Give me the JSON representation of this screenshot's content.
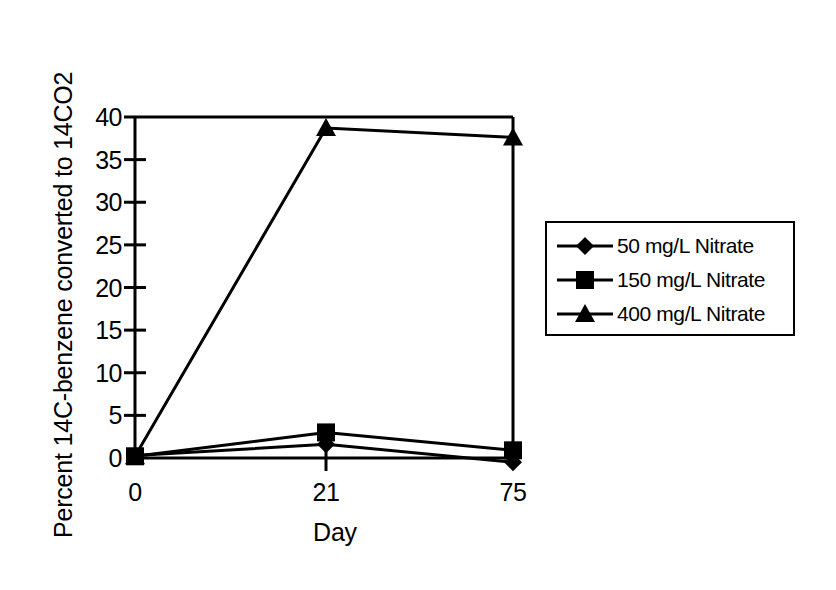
{
  "chart_data": {
    "type": "line",
    "title": "",
    "subtitle": "",
    "xlabel": "Day",
    "ylabel": "Percent 14C-benzene converted to 14CO2",
    "categories": [
      "0",
      "21",
      "75"
    ],
    "x": [
      0,
      21,
      75
    ],
    "xtick_labels": [
      "0",
      "21",
      "75"
    ],
    "ytick_labels": [
      "0",
      "5",
      "10",
      "15",
      "20",
      "25",
      "30",
      "35",
      "40"
    ],
    "ytick_values": [
      0,
      5,
      10,
      15,
      20,
      25,
      30,
      35,
      40
    ],
    "ylim": [
      0,
      40
    ],
    "grid": false,
    "legend_position": "right",
    "line_color": "#000000",
    "series": [
      {
        "name": "50 mg/L Nitrate",
        "marker": "diamond",
        "values": [
          0.3,
          1.6,
          -0.5
        ]
      },
      {
        "name": "150 mg/L Nitrate",
        "marker": "square",
        "values": [
          0.2,
          3.0,
          0.9
        ]
      },
      {
        "name": "400 mg/L Nitrate",
        "marker": "triangle",
        "values": [
          0.2,
          38.7,
          37.6
        ]
      }
    ]
  },
  "legend": {
    "items": [
      {
        "label": "50 mg/L Nitrate",
        "marker": "diamond-marker"
      },
      {
        "label": "150 mg/L Nitrate",
        "marker": "square-marker"
      },
      {
        "label": "400 mg/L Nitrate",
        "marker": "triangle-marker"
      }
    ]
  },
  "axes": {
    "y_title": "Percent 14C-benzene converted to 14CO2",
    "x_title": "Day",
    "y_ticks": [
      "40",
      "35",
      "30",
      "25",
      "20",
      "15",
      "10",
      "5",
      "0"
    ],
    "x_ticks": [
      "0",
      "21",
      "75"
    ]
  }
}
